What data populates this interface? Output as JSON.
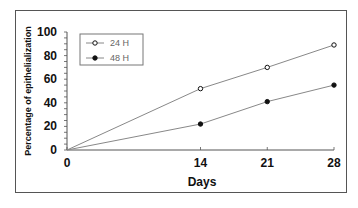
{
  "chart_data": {
    "type": "line",
    "title": "",
    "xlabel": "Days",
    "ylabel": "Percentage of epithelialization",
    "x": [
      0,
      14,
      21,
      28
    ],
    "x_tick_labels": [
      "0",
      "14",
      "21",
      "28"
    ],
    "y_ticks": [
      0,
      20,
      40,
      60,
      80,
      100
    ],
    "y_tick_labels": [
      "0",
      "20",
      "40",
      "60",
      "80",
      "100"
    ],
    "ylim": [
      0,
      100
    ],
    "xlim": [
      0,
      28
    ],
    "grid": false,
    "legend_position": "upper left",
    "series": [
      {
        "name": "24 H",
        "marker": "open-circle",
        "values": [
          0,
          52,
          70,
          89
        ]
      },
      {
        "name": "48 H",
        "marker": "filled-circle",
        "values": [
          0,
          22,
          41,
          55
        ]
      }
    ]
  },
  "colors": {
    "line": "#888888",
    "axis": "#555555",
    "marker": "#111111",
    "text": "#111111",
    "legend_text": "#666666"
  }
}
